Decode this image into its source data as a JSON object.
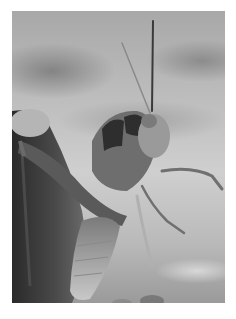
{
  "image": {
    "subject": "grasshopper perched on a fingertip",
    "style": "black-and-white photograph",
    "border_color": "#ffffff",
    "background_tone": "#bdbdbd"
  }
}
